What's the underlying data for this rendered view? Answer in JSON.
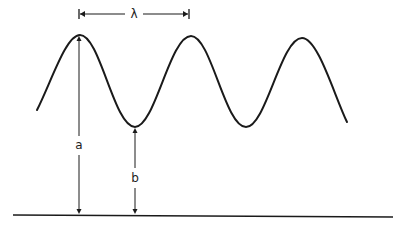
{
  "diagram": {
    "labels": {
      "wavelength": "λ",
      "amplitude_total": "a",
      "trough_height": "b"
    },
    "colors": {
      "stroke": "#1a1a1a",
      "background": "#ffffff"
    },
    "wave": {
      "type": "sinusoid",
      "peaks_visible": 3,
      "troughs_visible": 2
    }
  }
}
